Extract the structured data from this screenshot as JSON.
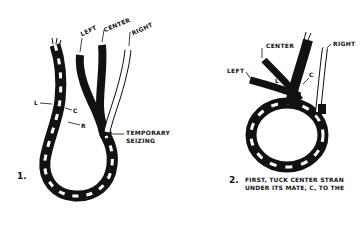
{
  "figure_1": {
    "number": "1.",
    "labels": {
      "left": "LEFT",
      "center": "CENTER",
      "right": "RIGHT",
      "l": "L",
      "c": "C",
      "r": "R",
      "seizing_line1": "TEMPORARY",
      "seizing_line2": "SEIZING"
    }
  },
  "figure_2": {
    "number": "2.",
    "labels": {
      "center": "CENTER",
      "right": "RIGHT",
      "left": "LEFT",
      "l": "L",
      "c": "C"
    },
    "caption_line1": "FIRST, TUCK CENTER STRAN",
    "caption_line2": "UNDER ITS MATE, C, TO THE"
  },
  "colors": {
    "ink": "#111111",
    "background": "#ffffff"
  }
}
